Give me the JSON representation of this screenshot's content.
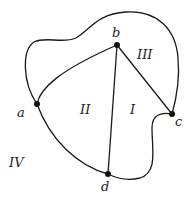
{
  "diagram": {
    "type": "planar-graph",
    "vertices": [
      {
        "id": "a",
        "label": "a",
        "x": 37,
        "y": 104
      },
      {
        "id": "b",
        "label": "b",
        "x": 117,
        "y": 45
      },
      {
        "id": "c",
        "label": "c",
        "x": 172,
        "y": 114
      },
      {
        "id": "d",
        "label": "d",
        "x": 108,
        "y": 174
      }
    ],
    "edges": [
      {
        "from": "a",
        "to": "b",
        "shape": "curve"
      },
      {
        "from": "b",
        "to": "d",
        "shape": "straight"
      },
      {
        "from": "b",
        "to": "c",
        "shape": "straight"
      },
      {
        "from": "a",
        "to": "d",
        "shape": "curve"
      },
      {
        "from": "a",
        "to": "c",
        "shape": "outer-curve-over-top"
      },
      {
        "from": "c",
        "to": "d",
        "shape": "outer-curve-bottom"
      }
    ],
    "regions": [
      {
        "id": "I",
        "label": "I"
      },
      {
        "id": "II",
        "label": "II"
      },
      {
        "id": "III",
        "label": "III"
      },
      {
        "id": "IV",
        "label": "IV"
      }
    ]
  }
}
